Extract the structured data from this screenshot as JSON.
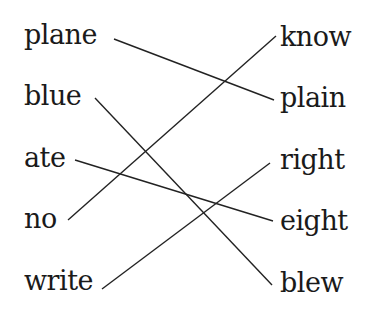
{
  "left_words": [
    {
      "text": "plane",
      "x": 24,
      "y": 20
    },
    {
      "text": "blue",
      "x": 24,
      "y": 81
    },
    {
      "text": "ate",
      "x": 24,
      "y": 143
    },
    {
      "text": "no",
      "x": 24,
      "y": 204
    },
    {
      "text": "write",
      "x": 24,
      "y": 266
    }
  ],
  "right_words": [
    {
      "text": "know",
      "x": 280,
      "y": 22
    },
    {
      "text": "plain",
      "x": 280,
      "y": 83
    },
    {
      "text": "right",
      "x": 280,
      "y": 145
    },
    {
      "text": "eight",
      "x": 280,
      "y": 206
    },
    {
      "text": "blew",
      "x": 280,
      "y": 268
    }
  ],
  "connections": [
    {
      "from": "plane",
      "to": "plain",
      "x1": 114,
      "y1": 39,
      "x2": 274,
      "y2": 100
    },
    {
      "from": "blue",
      "to": "blew",
      "x1": 95,
      "y1": 98,
      "x2": 272,
      "y2": 285
    },
    {
      "from": "ate",
      "to": "eight",
      "x1": 75,
      "y1": 160,
      "x2": 273,
      "y2": 221
    },
    {
      "from": "no",
      "to": "know",
      "x1": 68,
      "y1": 220,
      "x2": 276,
      "y2": 36
    },
    {
      "from": "write",
      "to": "right",
      "x1": 102,
      "y1": 289,
      "x2": 270,
      "y2": 163
    }
  ],
  "line_color": "#222222"
}
